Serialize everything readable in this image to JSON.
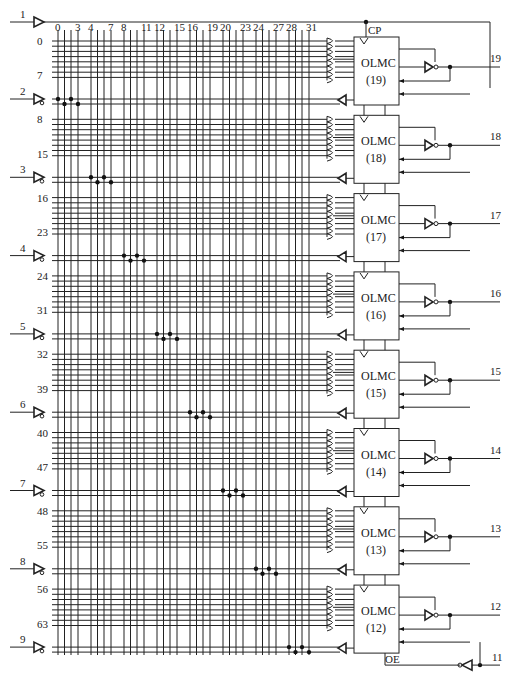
{
  "diagram": {
    "column_labels": [
      {
        "text": "0",
        "col": 0
      },
      {
        "text": "3",
        "col": 3
      },
      {
        "text": "4",
        "col": 4
      },
      {
        "text": "7",
        "col": 7
      },
      {
        "text": "8",
        "col": 8
      },
      {
        "text": "11",
        "col": 11
      },
      {
        "text": "12",
        "col": 12
      },
      {
        "text": "15",
        "col": 15
      },
      {
        "text": "16",
        "col": 16
      },
      {
        "text": "19",
        "col": 19
      },
      {
        "text": "20",
        "col": 20
      },
      {
        "text": "23",
        "col": 23
      },
      {
        "text": "24",
        "col": 24
      },
      {
        "text": "27",
        "col": 27
      },
      {
        "text": "28",
        "col": 28
      },
      {
        "text": "31",
        "col": 31
      }
    ],
    "input_pins": [
      "1",
      "2",
      "3",
      "4",
      "5",
      "6",
      "7",
      "8",
      "9"
    ],
    "clock_label": "CP",
    "oe_label": "OE",
    "oe_pin": "11",
    "olmc_blocks": [
      {
        "name": "OLMC",
        "index": "(19)",
        "pin": "19",
        "row_start": "0",
        "row_end": "7"
      },
      {
        "name": "OLMC",
        "index": "(18)",
        "pin": "18",
        "row_start": "8",
        "row_end": "15"
      },
      {
        "name": "OLMC",
        "index": "(17)",
        "pin": "17",
        "row_start": "16",
        "row_end": "23"
      },
      {
        "name": "OLMC",
        "index": "(16)",
        "pin": "16",
        "row_start": "24",
        "row_end": "31"
      },
      {
        "name": "OLMC",
        "index": "(15)",
        "pin": "15",
        "row_start": "32",
        "row_end": "39"
      },
      {
        "name": "OLMC",
        "index": "(14)",
        "pin": "14",
        "row_start": "40",
        "row_end": "47"
      },
      {
        "name": "OLMC",
        "index": "(13)",
        "pin": "13",
        "row_start": "48",
        "row_end": "55"
      },
      {
        "name": "OLMC",
        "index": "(12)",
        "pin": "12",
        "row_start": "56",
        "row_end": "63"
      }
    ],
    "colors": {
      "line": "#222222",
      "background": "#ffffff"
    }
  }
}
